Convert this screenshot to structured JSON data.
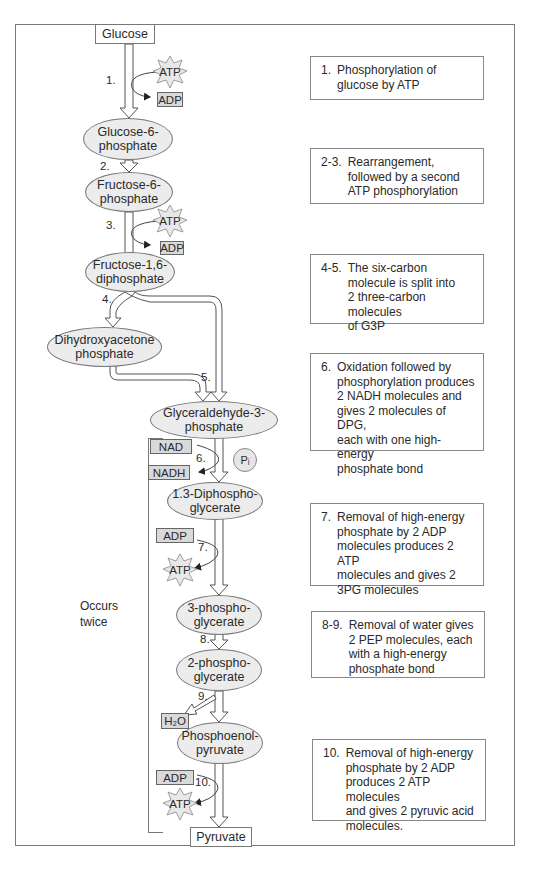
{
  "diagram": {
    "side_label": "Occurs\ntwice",
    "nodes": {
      "glucose": "Glucose",
      "g6p": "Glucose-6-\nphosphate",
      "f6p": "Fructose-6-\nphosphate",
      "f16dp": "Fructose-1,6-\ndiphosphate",
      "dhap": "Dihydroxyacetone\nphosphate",
      "g3p": "Glyceraldehyde-3-\nphosphate",
      "dpg": "1.3-Diphospho-\nglycerate",
      "pg3": "3-phospho-\nglycerate",
      "pg2": "2-phospho-\nglycerate",
      "pep": "Phosphoenol-\npyruvate",
      "pyruvate": "Pyruvate"
    },
    "cofactors": {
      "atp1": "ATP",
      "adp1": "ADP",
      "atp3": "ATP",
      "adp3": "ADP",
      "nad": "NAD",
      "nadh": "NADH",
      "pi": "Pᵢ",
      "adp7": "ADP",
      "atp7": "ATP",
      "h2o": "H₂O",
      "adp10": "ADP",
      "atp10": "ATP"
    },
    "step_labels": {
      "s1": "1.",
      "s2": "2.",
      "s3": "3.",
      "s4": "4.",
      "s5": "5.",
      "s6": "6.",
      "s7": "7.",
      "s8": "8.",
      "s9": "9.",
      "s10": "10."
    },
    "descriptions": [
      {
        "num": "1.",
        "text": "Phosphorylation of\nglucose by ATP"
      },
      {
        "num": "2-3.",
        "text": "Rearrangement,\nfollowed by a second\nATP phosphorylation"
      },
      {
        "num": "4-5.",
        "text": "The six-carbon\nmolecule is split into\n2 three-carbon molecules\nof G3P"
      },
      {
        "num": "6.",
        "text": "Oxidation followed by\nphosphorylation produces\n2 NADH molecules and\ngives 2 molecules of DPG,\neach with one high-energy\nphosphate bond"
      },
      {
        "num": "7.",
        "text": "Removal of high-energy\nphosphate by 2 ADP\nmolecules produces 2 ATP\nmolecules and gives 2\n3PG molecules"
      },
      {
        "num": "8-9.",
        "text": "Removal of water gives\n2 PEP molecules, each\nwith a high-energy\nphosphate bond"
      },
      {
        "num": "10.",
        "text": "Removal of high-energy\nphosphate by 2 ADP\nproduces 2 ATP molecules\nand gives 2 pyruvic acid\nmolecules."
      }
    ]
  }
}
